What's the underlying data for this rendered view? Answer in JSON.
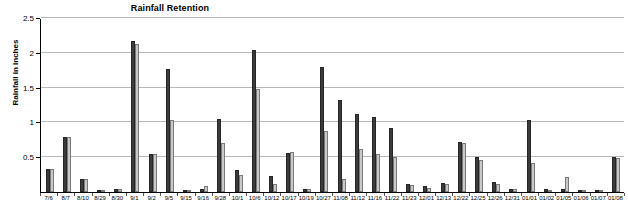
{
  "chart_data": {
    "type": "bar",
    "title": "Rainfall Retention",
    "xlabel": "",
    "ylabel": "Rainfall in inches",
    "ylim": [
      0,
      2.5
    ],
    "yticks": [
      0,
      0.5,
      1,
      1.5,
      2,
      2.5
    ],
    "ytick_labels": [
      "",
      "0.5",
      "1",
      "1.5",
      "2",
      "2.5"
    ],
    "grid": true,
    "legend_position": "none",
    "categories": [
      "7/6",
      "8/7",
      "8/10",
      "8/29",
      "8/30",
      "9/1",
      "9/2",
      "9/5",
      "9/15",
      "9/16",
      "9/28",
      "10/1",
      "10/6",
      "10/12",
      "10/17",
      "10/19",
      "10/27",
      "11/08",
      "11/12",
      "11/16",
      "11/22",
      "11/23",
      "12/01",
      "12/13",
      "12/22",
      "12/25",
      "12/26",
      "12/31",
      "01/01",
      "01/02",
      "01/05",
      "01/06",
      "01/07",
      "01/08"
    ],
    "series": [
      {
        "name": "Rainfall",
        "color": "#3b3b3b",
        "values": [
          0.33,
          0.79,
          0.19,
          0.03,
          0.04,
          2.17,
          0.55,
          1.77,
          0.03,
          0.05,
          1.05,
          0.31,
          2.04,
          0.23,
          0.56,
          0.04,
          1.8,
          1.32,
          1.12,
          1.08,
          0.92,
          0.11,
          0.09,
          0.13,
          0.72,
          0.5,
          0.14,
          0.05,
          1.04,
          0.04,
          0.05,
          0.03,
          0.03,
          0.51
        ]
      },
      {
        "name": "Retention",
        "color": "#c9c9c9",
        "values": [
          0.33,
          0.79,
          0.19,
          0.03,
          0.04,
          2.12,
          0.54,
          1.03,
          0.02,
          0.09,
          0.71,
          0.25,
          1.48,
          0.11,
          0.58,
          0.05,
          0.88,
          0.18,
          0.62,
          0.55,
          0.5,
          0.1,
          0.06,
          0.11,
          0.71,
          0.46,
          0.11,
          0.04,
          0.42,
          0.03,
          0.21,
          0.02,
          0.02,
          0.49
        ]
      }
    ]
  },
  "yaxis": {
    "title": "Rainfall in inches"
  }
}
